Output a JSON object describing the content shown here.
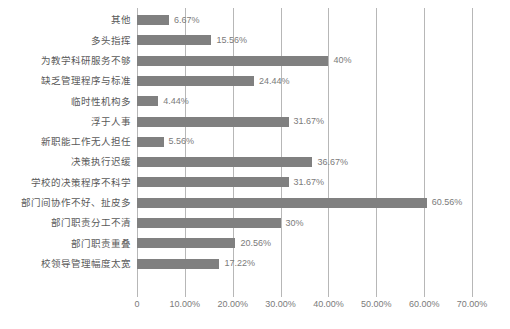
{
  "chart_data": {
    "type": "bar",
    "orientation": "horizontal",
    "title": "",
    "subtitle": "",
    "xlabel": "",
    "ylabel": "",
    "xlim": [
      0,
      70
    ],
    "grid": true,
    "legend": null,
    "bar_color": "#808080",
    "gridline_color": "#b7b7b7",
    "label_color": "#595959",
    "value_color": "#7b7b7b",
    "xticks": [
      0,
      10,
      20,
      30,
      40,
      50,
      60,
      70
    ],
    "xtick_labels": [
      "0",
      "10.00%",
      "20.00%",
      "30.00%",
      "40.00%",
      "50.00%",
      "60.00%",
      "70.00%"
    ],
    "categories": [
      "其他",
      "多头指挥",
      "为教学科研服务不够",
      "缺乏管理程序与标准",
      "临时性机构多",
      "浮于人事",
      "新职能工作无人担任",
      "决策执行迟缓",
      "学校的决策程序不科学",
      "部门间协作不好、扯皮多",
      "部门职责分工不清",
      "部门职责重叠",
      "校领导管理幅度太宽"
    ],
    "values": [
      6.67,
      15.56,
      40,
      24.44,
      4.44,
      31.67,
      5.56,
      36.67,
      31.67,
      60.56,
      30,
      20.56,
      17.22
    ],
    "value_labels": [
      "6.67%",
      "15.56%",
      "40%",
      "24.44%",
      "4.44%",
      "31.67%",
      "5.56%",
      "36.67%",
      "31.67%",
      "60.56%",
      "30%",
      "20.56%",
      "17.22%"
    ]
  }
}
